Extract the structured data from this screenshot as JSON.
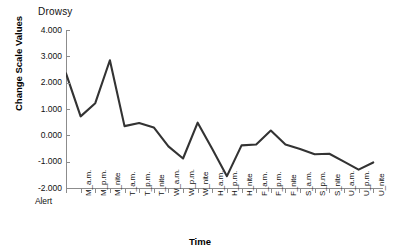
{
  "chart_title": "Drowsy",
  "axes": {
    "y_title": "Change Scale Values",
    "x_title": "Time"
  },
  "chart_data": {
    "type": "line",
    "title": "Drowsy",
    "xlabel": "Time",
    "ylabel": "Change Scale Values",
    "ylim": [
      -2.0,
      4.0
    ],
    "ytick_labels": [
      "4.000",
      "3.000",
      "2.000",
      "1.000",
      "0.000",
      "-1.000",
      "-2.000"
    ],
    "ytick_values": [
      4.0,
      3.0,
      2.0,
      1.0,
      0.0,
      -1.0,
      -2.0
    ],
    "grid": false,
    "legend": "none",
    "categories": [
      "Alert",
      "M_a.m.",
      "M_p.m.",
      "M_nite",
      "T_a.m.",
      "T_p.m.",
      "T_nite",
      "W_a.m.",
      "W_p.m.",
      "W_nite",
      "H_a.m.",
      "H_p.m.",
      "H_nite",
      "F_a.m.",
      "F_p.m.",
      "F_nite",
      "S_a.m.",
      "S_p.m.",
      "S_nite",
      "U_a.m.",
      "U_p.m.",
      "U_nite"
    ],
    "values": [
      2.35,
      0.72,
      1.22,
      2.85,
      0.35,
      0.47,
      0.3,
      -0.42,
      -0.88,
      0.48,
      -0.52,
      -1.55,
      -0.38,
      -0.35,
      0.18,
      -0.35,
      -0.52,
      -0.72,
      -0.7,
      -1.0,
      -1.3,
      -1.03
    ],
    "line_color": "#333333",
    "line_width": 2.1
  }
}
